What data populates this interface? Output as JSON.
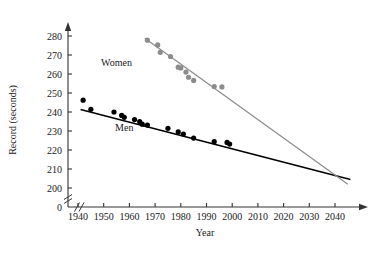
{
  "chart_data": {
    "type": "scatter",
    "title": "",
    "xlabel": "Year",
    "ylabel": "Record (seconds)",
    "xlim": [
      1936,
      2047
    ],
    "ylim": [
      200,
      283
    ],
    "xticks": [
      1940,
      1950,
      1960,
      1970,
      1980,
      1990,
      2000,
      2010,
      2020,
      2030,
      2040
    ],
    "yticks": [
      200,
      210,
      220,
      230,
      240,
      250,
      260,
      270,
      280
    ],
    "grid": false,
    "legend_position": "inline-annotations",
    "axis_break_x": true,
    "axis_break_y": true,
    "origin_label": "0",
    "series": [
      {
        "name": "Men",
        "color": "#000000",
        "marker": "filled-circle",
        "label_x": 1958,
        "label_y": 230,
        "points": [
          {
            "x": 1942,
            "y": 246.2
          },
          {
            "x": 1945,
            "y": 241.4
          },
          {
            "x": 1954,
            "y": 240.0
          },
          {
            "x": 1957,
            "y": 238.2
          },
          {
            "x": 1958,
            "y": 237.2
          },
          {
            "x": 1962,
            "y": 236.0
          },
          {
            "x": 1964,
            "y": 234.9
          },
          {
            "x": 1965,
            "y": 233.6
          },
          {
            "x": 1967,
            "y": 233.1
          },
          {
            "x": 1975,
            "y": 231.4
          },
          {
            "x": 1979,
            "y": 229.5
          },
          {
            "x": 1981,
            "y": 228.4
          },
          {
            "x": 1985,
            "y": 226.3
          },
          {
            "x": 1993,
            "y": 224.4
          },
          {
            "x": 1998,
            "y": 224.0
          },
          {
            "x": 1999,
            "y": 223.1
          }
        ],
        "trend": {
          "x1": 1941,
          "y1": 241.3,
          "x2": 2046,
          "y2": 204.5
        }
      },
      {
        "name": "Women",
        "color": "#8c8c8c",
        "marker": "filled-circle",
        "label_x": 1955,
        "label_y": 264,
        "points": [
          {
            "x": 1967,
            "y": 277.8
          },
          {
            "x": 1971,
            "y": 275.3
          },
          {
            "x": 1972,
            "y": 271.4
          },
          {
            "x": 1976,
            "y": 269.2
          },
          {
            "x": 1979,
            "y": 263.6
          },
          {
            "x": 1980,
            "y": 263.2
          },
          {
            "x": 1982,
            "y": 261.0
          },
          {
            "x": 1983,
            "y": 258.3
          },
          {
            "x": 1985,
            "y": 256.6
          },
          {
            "x": 1993,
            "y": 253.4
          },
          {
            "x": 1996,
            "y": 253.2
          }
        ],
        "trend": {
          "x1": 1966,
          "y1": 278.8,
          "x2": 2045,
          "y2": 202.0
        }
      }
    ],
    "annotations": [
      {
        "text": "Women",
        "x": 1955,
        "y": 264
      },
      {
        "text": "Men",
        "x": 1958,
        "y": 230
      }
    ]
  }
}
